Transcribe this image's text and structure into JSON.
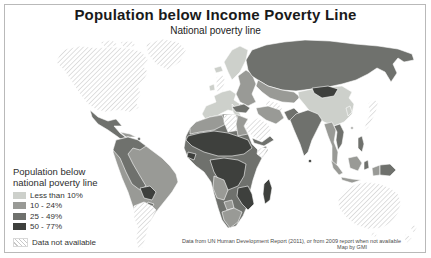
{
  "title": "Population below Income Poverty Line",
  "subtitle": "National poverty line",
  "legend": {
    "title_line1": "Population below",
    "title_line2": "national poverty line",
    "items": [
      {
        "label": "Less than 10%",
        "color": "#cdd0cb"
      },
      {
        "label": "10 - 24%",
        "color": "#999a96"
      },
      {
        "label": "25 - 49%",
        "color": "#6f716d"
      },
      {
        "label": "50 - 77%",
        "color": "#3e403d"
      },
      {
        "label": "Data not available",
        "color": "#c8c8c8"
      }
    ]
  },
  "source": {
    "line1": "Data from UN Human Development Report (2011), or from 2009 report when not available",
    "line2": "Map by GMI"
  },
  "map": {
    "type": "choropleth-world-map",
    "categories": [
      "lt10",
      "p10_24",
      "p25_49",
      "p50_77",
      "no_data"
    ],
    "regions": [
      {
        "name": "north-america",
        "category": "no_data"
      },
      {
        "name": "arctic-islands-west",
        "category": "no_data"
      },
      {
        "name": "arctic-islands-east",
        "category": "no_data"
      },
      {
        "name": "greenland",
        "category": "no_data"
      },
      {
        "name": "mexico-central-america",
        "category": "p25_49"
      },
      {
        "name": "cuba",
        "category": "p10_24"
      },
      {
        "name": "hispaniola",
        "category": "p50_77"
      },
      {
        "name": "brazil",
        "category": "p10_24"
      },
      {
        "name": "andean-south-america",
        "category": "p25_49"
      },
      {
        "name": "bolivia",
        "category": "p50_77"
      },
      {
        "name": "paraguay",
        "category": "p25_49"
      },
      {
        "name": "argentina-chile",
        "category": "no_data"
      },
      {
        "name": "iceland",
        "category": "lt10"
      },
      {
        "name": "ireland",
        "category": "lt10"
      },
      {
        "name": "united-kingdom",
        "category": "no_data"
      },
      {
        "name": "scandinavia",
        "category": "lt10"
      },
      {
        "name": "western-europe",
        "category": "lt10"
      },
      {
        "name": "italy",
        "category": "lt10"
      },
      {
        "name": "eastern-europe",
        "category": "p10_24"
      },
      {
        "name": "balkans",
        "category": "p25_49"
      },
      {
        "name": "turkey",
        "category": "p25_49"
      },
      {
        "name": "russia",
        "category": "p25_49"
      },
      {
        "name": "kazakhstan",
        "category": "p10_24"
      },
      {
        "name": "turkmenistan-uzbekistan",
        "category": "no_data"
      },
      {
        "name": "china",
        "category": "lt10"
      },
      {
        "name": "mongolia",
        "category": "p50_77"
      },
      {
        "name": "korea",
        "category": "lt10"
      },
      {
        "name": "japan",
        "category": "no_data"
      },
      {
        "name": "taiwan",
        "category": "p10_24"
      },
      {
        "name": "india",
        "category": "p25_49"
      },
      {
        "name": "sri-lanka",
        "category": "p50_77"
      },
      {
        "name": "pakistan-afghanistan",
        "category": "p25_49"
      },
      {
        "name": "iran",
        "category": "p10_24"
      },
      {
        "name": "saudi-arabia",
        "category": "no_data"
      },
      {
        "name": "yemen-oman",
        "category": "p25_49"
      },
      {
        "name": "africa-base",
        "category": "p25_49"
      },
      {
        "name": "northwest-africa",
        "category": "p10_24"
      },
      {
        "name": "libya",
        "category": "no_data"
      },
      {
        "name": "egypt",
        "category": "p10_24"
      },
      {
        "name": "sahel-sudan",
        "category": "p50_77"
      },
      {
        "name": "sierra-leone-liberia",
        "category": "p50_77"
      },
      {
        "name": "somalia",
        "category": "no_data"
      },
      {
        "name": "central-africa",
        "category": "p50_77"
      },
      {
        "name": "zambia-mozambique",
        "category": "p50_77"
      },
      {
        "name": "angola-namibia",
        "category": "p10_24"
      },
      {
        "name": "botswana",
        "category": "p10_24"
      },
      {
        "name": "south-africa",
        "category": "p10_24"
      },
      {
        "name": "madagascar",
        "category": "p50_77"
      },
      {
        "name": "myanmar-thailand",
        "category": "p10_24"
      },
      {
        "name": "vietnam-laos",
        "category": "p25_49"
      },
      {
        "name": "sumatra",
        "category": "p10_24"
      },
      {
        "name": "java",
        "category": "p10_24"
      },
      {
        "name": "borneo",
        "category": "p10_24"
      },
      {
        "name": "sulawesi",
        "category": "p25_49"
      },
      {
        "name": "philippines",
        "category": "p25_49"
      },
      {
        "name": "west-papua",
        "category": "p10_24"
      },
      {
        "name": "papua-new-guinea",
        "category": "p25_49"
      },
      {
        "name": "australia",
        "category": "no_data"
      },
      {
        "name": "tasmania",
        "category": "no_data"
      },
      {
        "name": "new-zealand-north",
        "category": "no_data"
      },
      {
        "name": "new-zealand-south",
        "category": "no_data"
      }
    ]
  }
}
